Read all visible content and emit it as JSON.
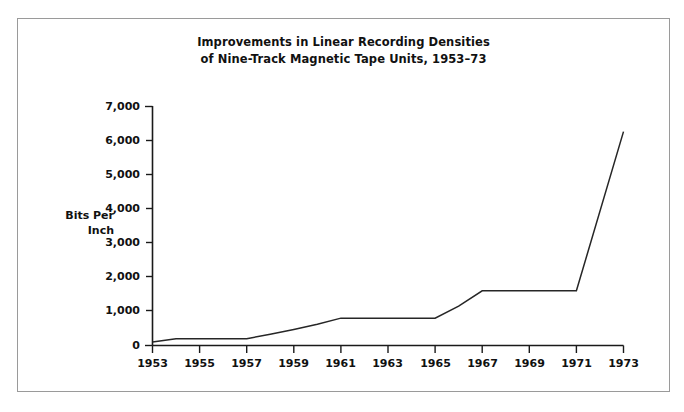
{
  "figure": {
    "background_color": "#ffffff",
    "border_color": "#9a9a9a",
    "line_color": "#262626",
    "text_color": "#111111"
  },
  "title": {
    "line1": "Improvements in Linear Recording Densities",
    "line2": "of Nine-Track Magnetic Tape Units, 1953–73"
  },
  "axis": {
    "y_label_line1": "Bits Per",
    "y_label_line2": "Inch",
    "y_ticks": [
      "7,000",
      "6,000",
      "5,000",
      "4,000",
      "3,000",
      "2,000",
      "1,000",
      "0"
    ],
    "x_ticks": [
      "1953",
      "1955",
      "1957",
      "1959",
      "1961",
      "1963",
      "1965",
      "1967",
      "1969",
      "1971",
      "1973"
    ]
  },
  "chart_data": {
    "type": "line",
    "xlabel": "",
    "ylabel": "Bits Per Inch",
    "xlim": [
      1953,
      1973
    ],
    "ylim": [
      0,
      7000
    ],
    "ytick_values": [
      0,
      1000,
      2000,
      3000,
      4000,
      5000,
      6000,
      7000
    ],
    "xtick_values": [
      1953,
      1955,
      1957,
      1959,
      1961,
      1963,
      1965,
      1967,
      1969,
      1971,
      1973
    ],
    "grid": false,
    "legend": "none",
    "x": [
      1953,
      1954,
      1957,
      1958,
      1959,
      1960,
      1961,
      1965,
      1966,
      1967,
      1971,
      1973
    ],
    "values": [
      100,
      200,
      200,
      330,
      470,
      620,
      800,
      800,
      1150,
      1600,
      1600,
      6250
    ],
    "series": [
      {
        "name": "Bits per inch",
        "points": [
          {
            "year": 1953,
            "value": 100
          },
          {
            "year": 1954,
            "value": 200
          },
          {
            "year": 1957,
            "value": 200
          },
          {
            "year": 1958,
            "value": 330
          },
          {
            "year": 1959,
            "value": 470
          },
          {
            "year": 1960,
            "value": 620
          },
          {
            "year": 1961,
            "value": 800
          },
          {
            "year": 1965,
            "value": 800
          },
          {
            "year": 1966,
            "value": 1150
          },
          {
            "year": 1967,
            "value": 1600
          },
          {
            "year": 1971,
            "value": 1600
          },
          {
            "year": 1973,
            "value": 6250
          }
        ]
      }
    ]
  }
}
